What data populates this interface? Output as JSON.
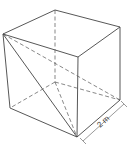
{
  "diagram": {
    "type": "cube",
    "edge_label": "2 m",
    "stroke_color": "#444444",
    "vertices": {
      "A": [
        3,
        34
      ],
      "B": [
        78,
        57
      ],
      "C": [
        120,
        27
      ],
      "D": [
        55,
        10
      ],
      "E": [
        10,
        108
      ],
      "F": [
        77,
        137
      ],
      "G": [
        120,
        100
      ],
      "H": [
        55,
        82
      ]
    }
  }
}
